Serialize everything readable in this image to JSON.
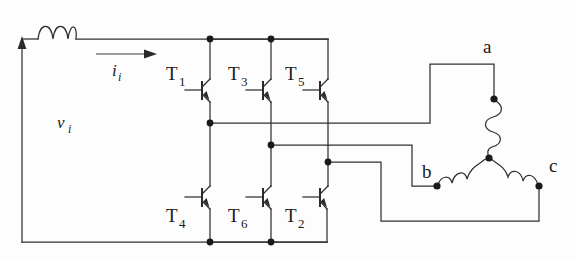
{
  "diagram": {
    "background_color": "#fdfdfd",
    "line_color": "#303030",
    "node_color": "#1a1a1a"
  },
  "source": {
    "voltage_label": "v",
    "voltage_label_sub": "i",
    "current_label": "i",
    "current_label_sub": "i",
    "inductor_name": "input-inductor",
    "inductor_turns": 3
  },
  "switches": [
    {
      "id": "T1",
      "label": "T",
      "sub": "1",
      "leg": "a",
      "side": "upper"
    },
    {
      "id": "T3",
      "label": "T",
      "sub": "3",
      "leg": "b",
      "side": "upper"
    },
    {
      "id": "T5",
      "label": "T",
      "sub": "5",
      "leg": "c",
      "side": "upper"
    },
    {
      "id": "T4",
      "label": "T",
      "sub": "4",
      "leg": "a",
      "side": "lower"
    },
    {
      "id": "T6",
      "label": "T",
      "sub": "6",
      "leg": "b",
      "side": "lower"
    },
    {
      "id": "T2",
      "label": "T",
      "sub": "2",
      "leg": "c",
      "side": "lower"
    }
  ],
  "load": {
    "type": "wye-connected-three-phase",
    "phases": [
      {
        "id": "a",
        "label": "a"
      },
      {
        "id": "b",
        "label": "b"
      },
      {
        "id": "c",
        "label": "c"
      }
    ],
    "winding_turns": 3,
    "neutral_name": "wye-neutral-node"
  },
  "rails": {
    "top_name": "dc-positive-rail",
    "bottom_name": "dc-negative-rail"
  }
}
